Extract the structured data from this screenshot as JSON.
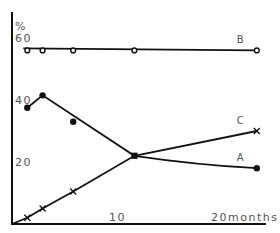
{
  "chart_data": {
    "type": "line",
    "title": "",
    "xlabel": "months",
    "ylabel": "%",
    "x_ticks": [
      {
        "value": 10,
        "label": "10"
      },
      {
        "value": 20,
        "label": "20months"
      }
    ],
    "y_ticks": [
      {
        "value": 20,
        "label": "20"
      },
      {
        "value": 40,
        "label": "40"
      },
      {
        "value": 60,
        "label": "60"
      }
    ],
    "xlim": [
      0,
      25
    ],
    "ylim": [
      0,
      68
    ],
    "grid": false,
    "legend": "inline labels at right end of each line",
    "x": [
      1.5,
      3,
      6,
      12,
      24
    ],
    "series": [
      {
        "name": "A",
        "marker": "filled-circle",
        "values": [
          37.5,
          41.5,
          33,
          22,
          18
        ]
      },
      {
        "name": "B",
        "marker": "open-circle",
        "values": [
          56,
          56,
          56,
          56,
          56
        ]
      },
      {
        "name": "C",
        "marker": "cross",
        "values": [
          2,
          5,
          10.5,
          22,
          30
        ]
      }
    ]
  },
  "axis": {
    "y_unit": "%"
  }
}
